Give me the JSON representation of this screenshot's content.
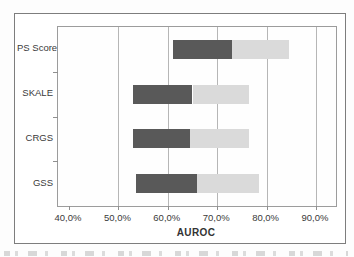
{
  "chart_data": {
    "type": "bar",
    "orientation": "horizontal",
    "title": "",
    "xlabel": "AUROC",
    "ylabel": "",
    "categories": [
      "PS Score",
      "SKALE",
      "CRGS",
      "GSS"
    ],
    "xlim": [
      40,
      90
    ],
    "x_tick_values": [
      40,
      50,
      60,
      70,
      80,
      90
    ],
    "x_tick_labels": [
      "40,0%",
      "50,0%",
      "60,0%",
      "70,0%",
      "80,0%",
      "90,0%"
    ],
    "grid": true,
    "legend": false,
    "value_unit": "percent",
    "series": [
      {
        "name": "lower-segment",
        "color": "#595959",
        "ranges": [
          [
            61.0,
            73.0
          ],
          [
            53.0,
            65.0
          ],
          [
            53.0,
            64.5
          ],
          [
            53.5,
            66.0
          ]
        ]
      },
      {
        "name": "upper-segment",
        "color": "#dadada",
        "ranges": [
          [
            73.0,
            84.5
          ],
          [
            65.0,
            76.5
          ],
          [
            64.5,
            76.5
          ],
          [
            66.0,
            78.5
          ]
        ]
      }
    ]
  },
  "colors": {
    "dark_segment": "#595959",
    "light_segment": "#dadada",
    "gridline": "#b6b6b6",
    "axis": "#8f8f8f",
    "frame_border": "#7d7d7d"
  }
}
